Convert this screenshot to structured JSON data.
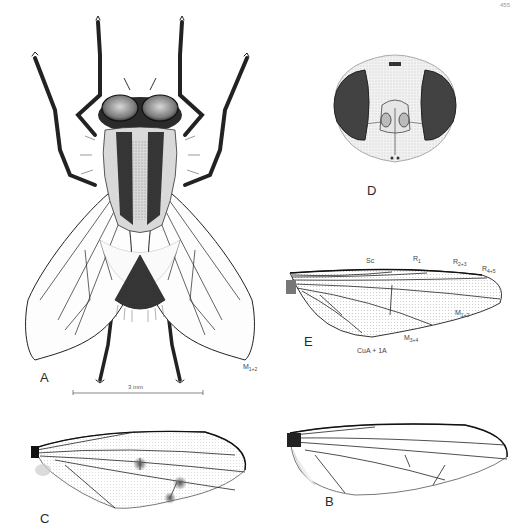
{
  "plate": {
    "page_number": "455",
    "figures": {
      "A": {
        "panel_label": "A",
        "subject": "whole fly, dorsal view",
        "vein_label": {
          "main": "M",
          "sub": "1+2"
        },
        "scale_bar": {
          "label": "3 mm"
        }
      },
      "B": {
        "panel_label": "B",
        "subject": "wing"
      },
      "C": {
        "panel_label": "C",
        "subject": "wing with infuscated crossveins"
      },
      "D": {
        "panel_label": "D",
        "subject": "head, frontal view"
      },
      "E": {
        "panel_label": "E",
        "subject": "wing with vein labels",
        "vein_labels": {
          "sc": {
            "main": "Sc",
            "sub": ""
          },
          "r1": {
            "main": "R",
            "sub": "1"
          },
          "r23": {
            "main": "R",
            "sub": "2+3"
          },
          "r45": {
            "main": "R",
            "sub": "4+5"
          },
          "m12": {
            "main": "M",
            "sub": "1+2"
          },
          "m34": {
            "main": "M",
            "sub": "3+4"
          },
          "cua": {
            "main": "CuA + 1A",
            "sub": ""
          }
        }
      }
    },
    "colors": {
      "ink": "#1a1a1a",
      "eye": "#3a3a3a",
      "stipple": "#8a8a8a",
      "background": "#ffffff"
    }
  }
}
